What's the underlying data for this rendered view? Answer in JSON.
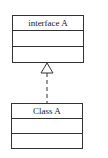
{
  "diagram": {
    "type": "uml-class",
    "interface_box": {
      "name": "interface A",
      "attributes": "",
      "operations": ""
    },
    "class_box": {
      "name": "Class A",
      "attributes": "",
      "operations": ""
    },
    "relationship": {
      "kind": "realization",
      "from": "Class A",
      "to": "interface A",
      "line_style": "dashed",
      "arrowhead": "hollow-triangle"
    },
    "colors": {
      "stroke": "#333333",
      "background": "#ffffff"
    }
  }
}
